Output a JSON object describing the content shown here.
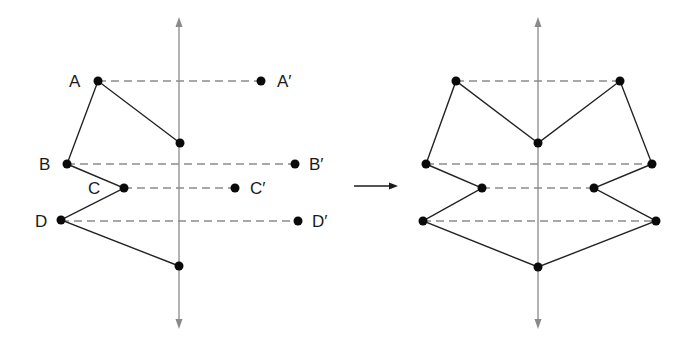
{
  "diagram": {
    "left_panel": {
      "axis": {
        "x": 179,
        "y_top": 17,
        "y_bottom": 329
      },
      "labels": {
        "A": "A",
        "B": "B",
        "C": "C",
        "D": "D",
        "A_prime": "A′",
        "B_prime": "B′",
        "C_prime": "C′",
        "D_prime": "D′"
      },
      "points": {
        "A": [
          98,
          81
        ],
        "top_axis_point": [
          180,
          143
        ],
        "B": [
          67,
          164
        ],
        "C": [
          124,
          188
        ],
        "D": [
          61,
          220
        ],
        "bottom_axis_point": [
          179,
          266
        ],
        "A_prime": [
          261,
          81
        ],
        "B_prime": [
          295,
          164
        ],
        "C_prime": [
          235,
          188
        ],
        "D_prime": [
          298,
          221
        ]
      }
    },
    "transform_arrow": {
      "x1": 354,
      "x2": 398,
      "y": 186
    },
    "right_panel": {
      "axis": {
        "x": 538,
        "y_top": 17,
        "y_bottom": 329
      },
      "points": {
        "A": [
          456,
          81
        ],
        "A_prime": [
          620,
          81
        ],
        "top_axis_point": [
          538,
          143
        ],
        "B": [
          426,
          164
        ],
        "B_prime": [
          652,
          164
        ],
        "C": [
          482,
          188
        ],
        "C_prime": [
          594,
          188
        ],
        "D": [
          423,
          221
        ],
        "D_prime": [
          656,
          221
        ],
        "bottom_axis_point": [
          538,
          267
        ]
      }
    },
    "colors": {
      "axis": "#8a8a8a",
      "dashed": "#8c8c8c",
      "edge": "#222222",
      "point": "#0a0a0a"
    }
  }
}
